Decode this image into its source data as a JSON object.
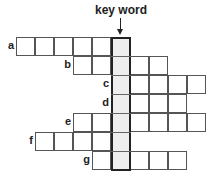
{
  "title": "key word",
  "rows": [
    {
      "label": "a",
      "before": 5,
      "after": 0
    },
    {
      "label": "b",
      "before": 2,
      "after": 2
    },
    {
      "label": "c",
      "before": 0,
      "after": 4
    },
    {
      "label": "d",
      "before": 0,
      "after": 3
    },
    {
      "label": "e",
      "before": 2,
      "after": 4
    },
    {
      "label": "f",
      "before": 4,
      "after": 0
    },
    {
      "label": "g",
      "before": 1,
      "after": 3
    }
  ],
  "colors": {
    "key_fill": "#eeeeee",
    "grid": "#555555",
    "key_border": "#222222"
  }
}
